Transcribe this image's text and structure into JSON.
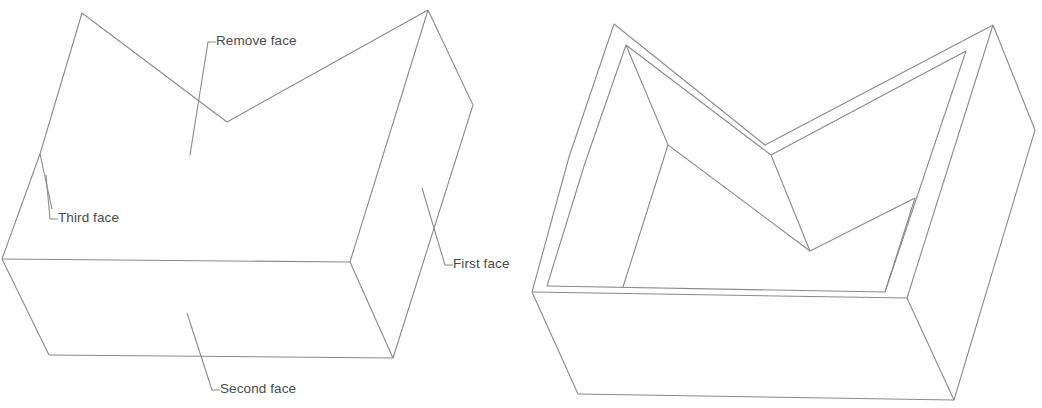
{
  "figure": {
    "background_color": "#ffffff",
    "line_color": "#8a8a8a",
    "text_color": "#4a4a4a",
    "width": 1042,
    "height": 408
  },
  "labels": {
    "remove_face": "Remove face",
    "third_face": "Third face",
    "second_face": "Second face",
    "first_face": "First face"
  },
  "left_figure": {
    "name": "solid-v-block-with-callouts",
    "description": "Isometric solid block with a V-shaped notch in the top surface, annotated with four face callouts"
  },
  "right_figure": {
    "name": "shelled-v-block",
    "description": "Same block after shelling, showing uniform wall thickness and the open top"
  }
}
